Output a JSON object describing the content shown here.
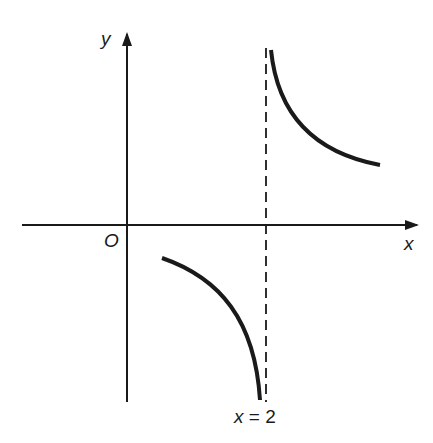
{
  "diagram": {
    "type": "graph-of-function-with-vertical-asymptote",
    "axes": {
      "x_label": "x",
      "y_label": "y",
      "origin_label": "O"
    },
    "asymptote": {
      "label_var": "x",
      "label_eq": "=",
      "label_val": "2",
      "style": "dashed"
    },
    "curves": [
      {
        "branch": "upper-right",
        "description": "decreasing from +infinity near x=2 toward a positive horizontal value"
      },
      {
        "branch": "lower-left",
        "description": "decreasing toward -infinity as x approaches 2 from the left"
      }
    ],
    "colors": {
      "stroke": "#1a1a1a",
      "background": "#ffffff"
    }
  }
}
